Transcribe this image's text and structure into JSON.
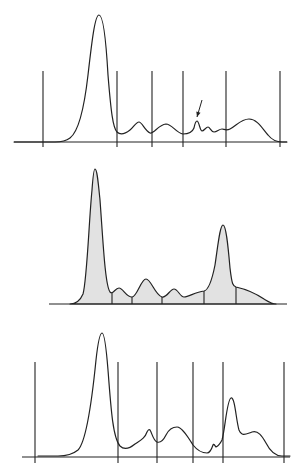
{
  "figure": {
    "width": 298,
    "height": 476,
    "colors": {
      "line": "#222222",
      "fill": "#e2e2e2",
      "background": "#ffffff"
    }
  },
  "chart_data": [
    {
      "type": "line",
      "title": "",
      "xlabel": "",
      "ylabel": "",
      "grid": false,
      "legend": null,
      "description": "Densitometric trace with vertical fraction delimiters; arrow marks a small split peak",
      "baseline": {
        "y": 142,
        "x_start": 14,
        "x_end": 287
      },
      "dividers": {
        "x": [
          43,
          117,
          152,
          183,
          226,
          280
        ],
        "top": 71,
        "bottom": 147
      },
      "peaks": [
        {
          "x": 99,
          "y": 15,
          "label": "major peak"
        },
        {
          "x": 139,
          "y": 122
        },
        {
          "x": 166,
          "y": 124
        },
        {
          "x": 197,
          "y": 121,
          "annotated": true
        },
        {
          "x": 208,
          "y": 127
        },
        {
          "x": 222,
          "y": 129
        },
        {
          "x": 249,
          "y": 119
        }
      ],
      "annotation": {
        "type": "arrow",
        "from": [
          202,
          100
        ],
        "to": [
          197,
          117
        ]
      },
      "path": "M14,142 L55,142 C62,142 66,141 70,138 C78,132 84,110 88,75 C92,40 95,15 99,15 C103,15 106,40 108,75 C111,112 113,128 117,132 C120,135 125,134 130,130 C134,127 136,122 139,122 C142,122 145,131 150,133 C154,134 158,125 166,124 C172,124 176,133 183,134 C188,134 192,133 194,128 C195,123 196,121 197,121 C199,121 200,131 202,131 C204,131 206,127 208,127 C210,127 211,132 214,132 C217,132 219,129 222,129 C224,129 226,131 230,129 C236,126 241,119 249,119 C257,119 262,128 268,135 C272,140 276,142 282,142 L287,142",
      "filled": false
    },
    {
      "type": "area",
      "title": "",
      "xlabel": "",
      "ylabel": "",
      "grid": false,
      "legend": null,
      "description": "Shaded densitometric trace, fractions separated by short vertical lines under the curve",
      "baseline": {
        "y": 304,
        "x_start": 49,
        "x_end": 287
      },
      "dividers": {
        "x": [
          112,
          132,
          162,
          204,
          236
        ],
        "top": null,
        "bottom": 304
      },
      "peaks": [
        {
          "x": 95,
          "y": 169,
          "label": "major peak"
        },
        {
          "x": 119,
          "y": 288
        },
        {
          "x": 146,
          "y": 279
        },
        {
          "x": 174,
          "y": 289
        },
        {
          "x": 223,
          "y": 225,
          "label": "second major peak"
        }
      ],
      "path": "M70,304 C76,304 80,301 83,294 C87,280 89,220 92,190 C93,176 94,169 95,169 C97,169 98,180 100,200 C103,240 105,285 110,292 C113,295 115,288 119,288 C123,288 126,297 132,297 C137,297 141,279 146,279 C151,279 155,295 162,297 C167,298 170,289 174,289 C178,289 180,297 184,297 C189,297 195,292 204,291 C209,290 212,280 215,265 C218,245 220,225 223,225 C226,225 228,245 230,268 C232,285 233,286 236,287 C245,289 255,293 264,299 C269,302 272,304 276,304 Z",
      "filled": true
    },
    {
      "type": "line",
      "title": "",
      "xlabel": "",
      "ylabel": "",
      "grid": false,
      "legend": null,
      "description": "Densitometric trace with vertical fraction delimiters",
      "baseline": {
        "y": 457,
        "x_start": 22,
        "x_end": 290
      },
      "dividers": {
        "x": [
          35,
          118,
          157,
          193,
          223,
          284
        ],
        "top": 362,
        "bottom": 463
      },
      "peaks": [
        {
          "x": 102,
          "y": 333,
          "label": "major peak"
        },
        {
          "x": 149,
          "y": 429
        },
        {
          "x": 177,
          "y": 427
        },
        {
          "x": 214,
          "y": 442
        },
        {
          "x": 231,
          "y": 398,
          "label": "second major peak"
        },
        {
          "x": 256,
          "y": 432
        }
      ],
      "path": "M38,456 L58,456 C66,456 72,455 78,450 C86,442 92,400 96,360 C98,342 100,333 102,333 C104,333 106,345 108,370 C111,410 113,438 120,446 C124,450 129,449 135,444 C141,440 145,438 147,432 C148,430 149,429 150,430 C152,433 153,440 157,442 C160,443 163,441 166,435 C169,429 173,427 177,427 C182,427 188,437 193,445 C197,450 202,453 207,453 C210,453 212,448 213,445 C214,443 215,446 216,447 C218,446 220,444 222,440 C225,430 227,399 231,398 C235,397 236,420 239,430 C242,437 246,434 252,432 C258,430 262,436 266,443 C270,451 275,456 282,456 L290,456",
      "filled": false
    }
  ]
}
